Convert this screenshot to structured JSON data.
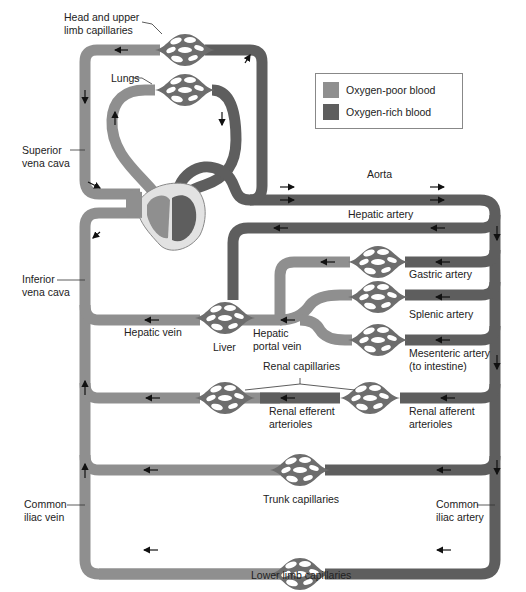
{
  "diagram": {
    "colors": {
      "oxygen_poor": "#8f8f8f",
      "oxygen_rich": "#5e5e5e",
      "capillary_hole": "#ffffff",
      "heart_outline": "#e2e2e2"
    },
    "legend": {
      "items": [
        {
          "label": "Oxygen-poor blood",
          "color": "#8f8f8f"
        },
        {
          "label": "Oxygen-rich blood",
          "color": "#5e5e5e"
        }
      ]
    },
    "labels": {
      "head_capillaries": "Head and upper\nlimb capillaries",
      "lungs": "Lungs",
      "superior_vena_cava": "Superior\nvena cava",
      "aorta": "Aorta",
      "hepatic_artery": "Hepatic artery",
      "inferior_vena_cava": "Inferior\nvena cava",
      "gastric_artery": "Gastric artery",
      "splenic_artery": "Splenic artery",
      "hepatic_vein": "Hepatic vein",
      "liver": "Liver",
      "hepatic_portal_vein": "Hepatic\nportal vein",
      "mesenteric_artery": "Mesenteric artery\n(to intestine)",
      "renal_capillaries": "Renal capillaries",
      "renal_efferent": "Renal efferent\narterioles",
      "renal_afferent": "Renal afferent\narterioles",
      "trunk_capillaries": "Trunk capillaries",
      "common_iliac_vein": "Common\niliac vein",
      "common_iliac_artery": "Common\niliac artery",
      "lower_limb_capillaries": "Lower limb capillaries"
    }
  }
}
